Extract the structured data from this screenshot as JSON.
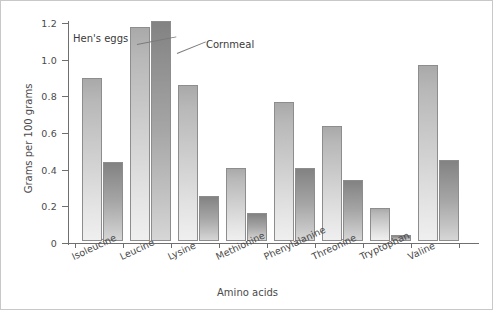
{
  "chart_data": {
    "type": "bar",
    "title": "",
    "xlabel": "Amino acids",
    "ylabel": "Grams per 100 grams",
    "categories": [
      "Isoleucine",
      "Leucine",
      "Lysine",
      "Methionine",
      "Phenylalanine",
      "Threonine",
      "Tryptophan",
      "Valine"
    ],
    "series": [
      {
        "name": "Hen's eggs",
        "values": [
          0.89,
          1.17,
          0.85,
          0.4,
          0.76,
          0.63,
          0.18,
          0.96
        ],
        "color": "#cfcfcf"
      },
      {
        "name": "Cornmeal",
        "values": [
          0.43,
          1.2,
          0.245,
          0.155,
          0.4,
          0.335,
          0.035,
          0.44
        ],
        "color": "#a6a6a6"
      }
    ],
    "ylim": [
      0,
      1.2
    ],
    "ytick_labels": [
      "0",
      "0.2",
      "0.4",
      "0.6",
      "0.8",
      "1.0",
      "1.2"
    ],
    "ytick_values": [
      0,
      0.2,
      0.4,
      0.6,
      0.8,
      1.0,
      1.2
    ],
    "grid": false,
    "legend_position": "inline-callout",
    "annotations": [
      {
        "text": "Hen's eggs",
        "points_to": "Leucine light bar"
      },
      {
        "text": "Cornmeal",
        "points_to": "Leucine dark bar"
      }
    ]
  }
}
